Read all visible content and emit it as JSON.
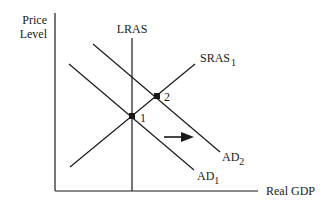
{
  "diagram": {
    "type": "AD-AS model",
    "axes": {
      "y_label_line1": "Price",
      "y_label_line2": "Level",
      "x_label": "Real GDP"
    },
    "curves": {
      "lras": {
        "label": "LRAS"
      },
      "sras": {
        "label": "SRAS",
        "subscript": "1"
      },
      "ad1": {
        "label": "AD",
        "subscript": "1"
      },
      "ad2": {
        "label": "AD",
        "subscript": "2"
      }
    },
    "points": {
      "p1": {
        "label": "1"
      },
      "p2": {
        "label": "2"
      }
    },
    "arrow": {
      "direction": "right",
      "meaning": "AD shifts right from AD1 to AD2"
    }
  }
}
